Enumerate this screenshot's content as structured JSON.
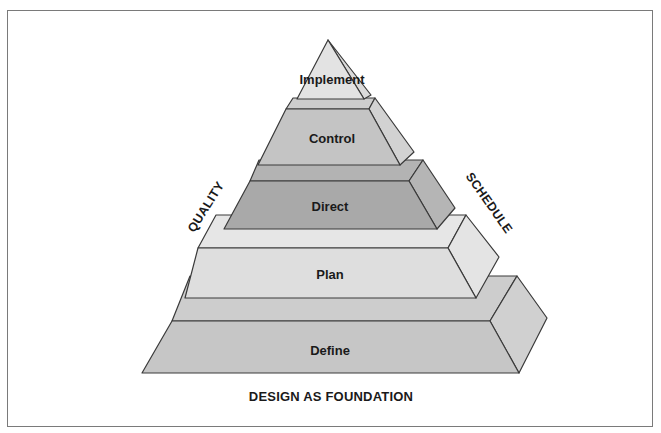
{
  "diagram": {
    "levels": [
      {
        "label": "Implement",
        "front": "#e3e3e3",
        "top": "#ececec",
        "side": "#dadada"
      },
      {
        "label": "Control",
        "front": "#c4c4c4",
        "top": "#cdcdcd",
        "side": "#d2d2d2"
      },
      {
        "label": "Direct",
        "front": "#a9a9a9",
        "top": "#b3b3b3",
        "side": "#b5b5b5"
      },
      {
        "label": "Plan",
        "front": "#dedede",
        "top": "#e6e6e6",
        "side": "#e4e4e4"
      },
      {
        "label": "Define",
        "front": "#c6c6c6",
        "top": "#cdcdcd",
        "side": "#d0d0d0"
      }
    ],
    "left_axis": "QUALITY",
    "right_axis": "SCHEDULE",
    "caption": "DESIGN AS FOUNDATION",
    "stroke": "#3a3a3a"
  }
}
